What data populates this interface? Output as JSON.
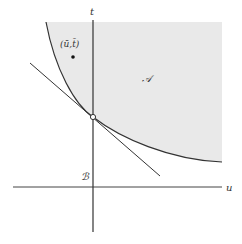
{
  "diagram": {
    "type": "convex-set-separation",
    "colors": {
      "region_fill": "#e9e9e9",
      "stroke": "#333333",
      "background": "#ffffff"
    },
    "axes": {
      "horizontal_label": "u",
      "vertical_label": "t"
    },
    "regions": {
      "A": {
        "label": "𝒜"
      },
      "B": {
        "label": "ℬ"
      }
    },
    "point": {
      "label": "(ū,t̄)"
    },
    "touch_point": {
      "marker": "open-circle"
    }
  }
}
